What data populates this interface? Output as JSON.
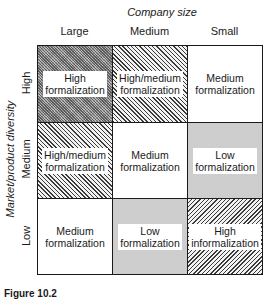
{
  "figure": {
    "column_axis_title": "Company size",
    "row_axis_title": "Market/product diversity",
    "columns": [
      "Large",
      "Medium",
      "Small"
    ],
    "rows": [
      "High",
      "Medium",
      "Low"
    ],
    "cells": [
      [
        {
          "line1": "High",
          "line2": "formalization",
          "pattern": "dense-gray"
        },
        {
          "line1": "High/medium",
          "line2": "formalization",
          "pattern": "diagonal-hatch"
        },
        {
          "line1": "Medium",
          "line2": "formalization",
          "pattern": "white"
        }
      ],
      [
        {
          "line1": "High/medium",
          "line2": "formalization",
          "pattern": "diagonal-hatch"
        },
        {
          "line1": "Medium",
          "line2": "formalization",
          "pattern": "white"
        },
        {
          "line1": "Low",
          "line2": "formalization",
          "pattern": "light-dots"
        }
      ],
      [
        {
          "line1": "Medium",
          "line2": "formalization",
          "pattern": "white"
        },
        {
          "line1": "Low",
          "line2": "formalization",
          "pattern": "light-dots"
        },
        {
          "line1": "High",
          "line2": "informalization",
          "pattern": "reverse-diagonal-hatch"
        }
      ]
    ],
    "caption": "Figure 10.2"
  }
}
